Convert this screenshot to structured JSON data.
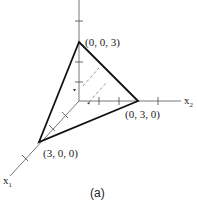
{
  "figure": {
    "caption": "(a)",
    "axes": {
      "x1": {
        "label": "x",
        "subscript": "1"
      },
      "x2": {
        "label": "x",
        "subscript": "2"
      },
      "x3": {
        "label": "",
        "subscript": ""
      }
    },
    "vertices": [
      {
        "id": "v-z",
        "label": "(0, 0, 3)"
      },
      {
        "id": "v-y",
        "label": "(0, 3, 0)"
      },
      {
        "id": "v-x",
        "label": "(3, 0, 0)"
      }
    ],
    "colors": {
      "edge": "#111111",
      "axis": "#555555",
      "dashed": "#888888",
      "background": "#ffffff"
    }
  }
}
